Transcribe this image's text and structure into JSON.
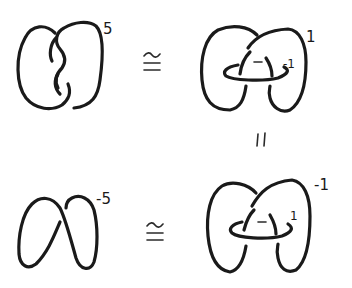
{
  "diagram": {
    "type": "kirby-diagram-equivalence",
    "panels": [
      {
        "id": "top-left",
        "description": "Two-component twisted knot diagram with framing",
        "framing": "5"
      },
      {
        "id": "top-right",
        "description": "Surgery diagram with unknot linking and minus sign",
        "framing_outer": "1",
        "framing_inner": "-1",
        "inner_sign": "−"
      },
      {
        "id": "bottom-left",
        "description": "Simple loop knot diagram with framing",
        "framing": "-5"
      },
      {
        "id": "bottom-right",
        "description": "Surgery diagram with unknot linking and minus sign",
        "framing_outer": "-1",
        "framing_inner": "1",
        "inner_sign": "−"
      }
    ],
    "relations": {
      "top_row": "≅",
      "bottom_row": "≅",
      "vertical": "="
    }
  },
  "labels": {
    "tl_framing": "5",
    "tr_outer": "1",
    "tr_inner": "-1",
    "tr_sign": "−",
    "bl_framing": "-5",
    "br_outer": "-1",
    "br_inner": "1",
    "br_sign": "−",
    "cong_top": "≅",
    "cong_bottom": "≅",
    "equals_vertical": "||"
  },
  "colors": {
    "ink": "#1a1a1a",
    "background": "#ffffff"
  }
}
